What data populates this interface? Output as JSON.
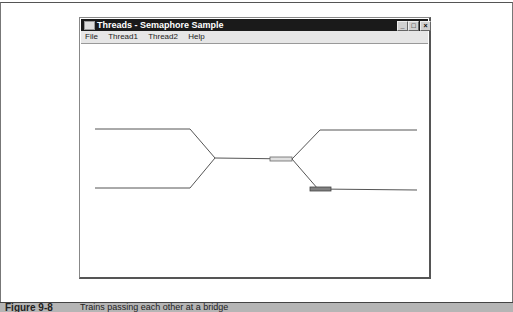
{
  "window": {
    "title": "Threads - Semaphore Sample",
    "controls": {
      "minimize": "_",
      "maximize": "□",
      "close": "×"
    }
  },
  "menu": [
    "File",
    "Thread1",
    "Thread2",
    "Help"
  ],
  "canvas": {
    "track_color": "#555555",
    "trains": [
      {
        "name": "train-1",
        "color": "#e0e0e0",
        "x": 270,
        "y": 157,
        "w": 22,
        "h": 4
      },
      {
        "name": "train-2",
        "color": "#808080",
        "x": 310,
        "y": 187,
        "w": 21,
        "h": 4
      }
    ]
  },
  "caption": {
    "label": "Figure 9-8",
    "text": "Trains passing each other at a bridge"
  }
}
